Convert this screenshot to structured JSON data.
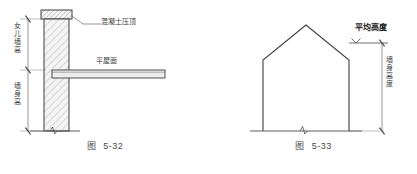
{
  "page": {
    "background_color": "#ffffff",
    "line_color": "#4a4a4a",
    "hatch_color": "#8a8a8a",
    "fill_color": "#f2f2f2"
  },
  "figures": [
    {
      "id": "fig-5-32",
      "caption_word": "图",
      "caption_number": "5-32",
      "description": "parapet wall and flat roof section detail",
      "labels": {
        "coping": "混凝土压顶",
        "flat_roof": "平屋面",
        "parapet_height": "女儿墙高",
        "wall_height": "墙身高"
      }
    },
    {
      "id": "fig-5-33",
      "caption_word": "图",
      "caption_number": "5-33",
      "description": "gable building elevation with average height dimension",
      "labels": {
        "average_height": "平均高度",
        "wall_height": "墙身高度"
      }
    }
  ]
}
